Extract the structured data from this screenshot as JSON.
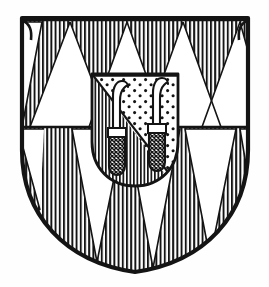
{
  "image": {
    "kind": "heraldic-coat-of-arms",
    "title": "Coat of arms",
    "description": "Heraldic shield, line-engraving style, black ink on white",
    "background_color": "#fefefe",
    "ink_color": "#111111"
  },
  "shield": {
    "name": "escutcheon",
    "outline_color": "#111111",
    "outline_width_px": 4,
    "top_y": 18,
    "left_x": 22,
    "right_x": 248,
    "bottom_y": 272,
    "field": {
      "tincture_hatch": "vertical-lines",
      "tincture_name": "gules",
      "hatch_color": "#111111",
      "hatch_spacing_px": 4.2,
      "hatch_line_width_px": 1.9
    },
    "charges_pattern": {
      "name": "piles-in-point-vair-like",
      "triangle_fill": "#ffffff",
      "upper_row": {
        "count": 4,
        "baseline_y": 127,
        "apex_y": 22,
        "apex_xs": [
          70,
          127,
          183,
          237
        ],
        "half_width_px": 40,
        "edge_partials": [
          22,
          248
        ]
      },
      "lower_row": {
        "count": 3,
        "baseline_y": 127,
        "apex_y": 262,
        "apex_xs": [
          97,
          153,
          210
        ],
        "half_width_px": 28
      },
      "divider_line_y": 127
    }
  },
  "inescutcheon": {
    "name": "inner-shield",
    "left_x": 92,
    "right_x": 178,
    "top_y": 74,
    "shoulder_y": 145,
    "bottom_y": 186,
    "division": "per-bend",
    "upper_right": {
      "tincture_hatch": "stippled-dots",
      "tincture_name": "or-sable-semy",
      "dot_color": "#111111",
      "dot_radius_px": 1.5,
      "dot_count": 74
    },
    "lower_left": {
      "tincture_hatch": "vertical-lines",
      "tincture_name": "gules",
      "hatch_spacing_px": 3.6
    },
    "outline_color": "#111111",
    "outline_width_px": 2.4
  },
  "charges": [
    {
      "name": "billhook-left",
      "type": "vine-knife",
      "blade_fill": "#ffffff",
      "blade_outline": "#111111",
      "handle_fill": "cross-hatched",
      "handle_top_y": 128,
      "handle_bottom_y": 172,
      "blade_tip_x": 110,
      "blade_tip_y": 84,
      "shaft_x": 117
    },
    {
      "name": "billhook-right",
      "type": "vine-knife",
      "blade_fill": "#ffffff",
      "blade_outline": "#111111",
      "handle_fill": "cross-hatched",
      "handle_top_y": 124,
      "handle_bottom_y": 170,
      "blade_tip_x": 150,
      "blade_tip_y": 81,
      "shaft_x": 157
    }
  ],
  "legend": {
    "hatching_meaning_vertical": "gules (red)",
    "hatching_meaning_dots": "or (gold)",
    "plain_white": "argent (silver)"
  }
}
